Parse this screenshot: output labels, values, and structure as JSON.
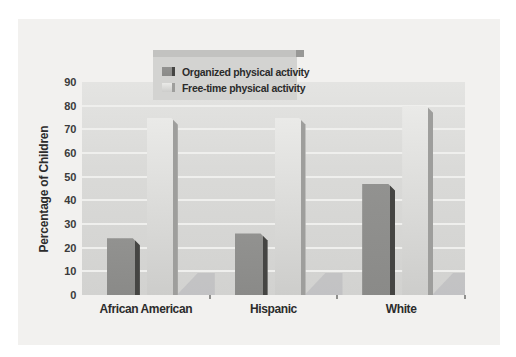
{
  "figure": {
    "background": "#ffffff",
    "panel_background": "#f2f1ef",
    "plot_bg_top": "#e4e4e2",
    "plot_bg_bottom": "#d2d2d0",
    "grid_color": "#efefed",
    "shadow_color": "#c0c0c2",
    "text_color": "#2c2c2c"
  },
  "chart_data": {
    "type": "bar",
    "title": "",
    "xlabel": "",
    "ylabel": "Percentage of Children",
    "categories": [
      "African American",
      "Hispanic",
      "White"
    ],
    "series": [
      {
        "name": "Organized physical activity",
        "values": [
          24,
          26,
          47
        ],
        "color": "#929290",
        "color_bottom": "#8a8a88",
        "edge_color": "#454543"
      },
      {
        "name": "Free-time physical activity",
        "values": [
          75,
          75,
          80
        ],
        "color": "#eaeae8",
        "color_bottom": "#cdcdcb",
        "edge_color": "#9e9e9c"
      }
    ],
    "ylim": [
      0,
      90
    ],
    "yticks": [
      0,
      10,
      20,
      30,
      40,
      50,
      60,
      70,
      80,
      90
    ],
    "grid": true,
    "legend_position": "top-center",
    "style_3d": true
  }
}
